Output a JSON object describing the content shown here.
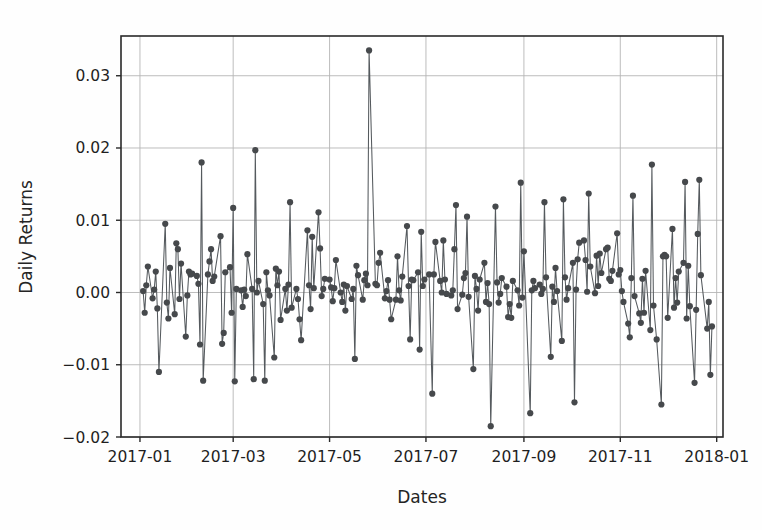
{
  "chart_data": {
    "type": "line",
    "title": "",
    "xlabel": "Dates",
    "ylabel": "Daily Returns",
    "grid": true,
    "legend": null,
    "marker": "circle",
    "line_color": "#555a5e",
    "marker_color": "#46494c",
    "grid_color": "#b6b6b6",
    "background_color": "#fefefe",
    "ylim": [
      -0.02,
      0.0355
    ],
    "xlim": [
      "2016-12-20",
      "2018-01-05"
    ],
    "yticks": [
      -0.02,
      -0.01,
      0.0,
      0.01,
      0.02,
      0.03
    ],
    "ytick_labels": [
      "−0.02",
      "−0.01",
      "0.00",
      "0.01",
      "0.02",
      "0.03"
    ],
    "xticks": [
      "2017-01",
      "2017-03",
      "2017-05",
      "2017-07",
      "2017-09",
      "2017-11",
      "2018-01"
    ],
    "xtick_labels": [
      "2017-01",
      "2017-03",
      "2017-05",
      "2017-07",
      "2017-09",
      "2017-11",
      "2018-01"
    ],
    "x": [
      "2017-01-03",
      "2017-01-04",
      "2017-01-05",
      "2017-01-06",
      "2017-01-09",
      "2017-01-10",
      "2017-01-11",
      "2017-01-12",
      "2017-01-13",
      "2017-01-17",
      "2017-01-18",
      "2017-01-19",
      "2017-01-20",
      "2017-01-23",
      "2017-01-24",
      "2017-01-25",
      "2017-01-26",
      "2017-01-27",
      "2017-01-30",
      "2017-01-31",
      "2017-02-01",
      "2017-02-02",
      "2017-02-03",
      "2017-02-06",
      "2017-02-07",
      "2017-02-08",
      "2017-02-09",
      "2017-02-10",
      "2017-02-13",
      "2017-02-14",
      "2017-02-15",
      "2017-02-16",
      "2017-02-17",
      "2017-02-21",
      "2017-02-22",
      "2017-02-23",
      "2017-02-24",
      "2017-02-27",
      "2017-02-28",
      "2017-03-01",
      "2017-03-02",
      "2017-03-03",
      "2017-03-06",
      "2017-03-07",
      "2017-03-08",
      "2017-03-09",
      "2017-03-10",
      "2017-03-13",
      "2017-03-14",
      "2017-03-15",
      "2017-03-16",
      "2017-03-17",
      "2017-03-20",
      "2017-03-21",
      "2017-03-22",
      "2017-03-23",
      "2017-03-24",
      "2017-03-27",
      "2017-03-28",
      "2017-03-29",
      "2017-03-30",
      "2017-03-31",
      "2017-04-03",
      "2017-04-04",
      "2017-04-05",
      "2017-04-06",
      "2017-04-07",
      "2017-04-10",
      "2017-04-11",
      "2017-04-12",
      "2017-04-13",
      "2017-04-17",
      "2017-04-18",
      "2017-04-19",
      "2017-04-20",
      "2017-04-21",
      "2017-04-24",
      "2017-04-25",
      "2017-04-26",
      "2017-04-27",
      "2017-04-28",
      "2017-05-01",
      "2017-05-02",
      "2017-05-03",
      "2017-05-04",
      "2017-05-05",
      "2017-05-08",
      "2017-05-09",
      "2017-05-10",
      "2017-05-11",
      "2017-05-12",
      "2017-05-15",
      "2017-05-16",
      "2017-05-17",
      "2017-05-18",
      "2017-05-19",
      "2017-05-22",
      "2017-05-23",
      "2017-05-24",
      "2017-05-25",
      "2017-05-26",
      "2017-05-30",
      "2017-05-31",
      "2017-06-01",
      "2017-06-02",
      "2017-06-05",
      "2017-06-06",
      "2017-06-07",
      "2017-06-08",
      "2017-06-09",
      "2017-06-12",
      "2017-06-13",
      "2017-06-14",
      "2017-06-15",
      "2017-06-16",
      "2017-06-19",
      "2017-06-20",
      "2017-06-21",
      "2017-06-22",
      "2017-06-23",
      "2017-06-26",
      "2017-06-27",
      "2017-06-28",
      "2017-06-29",
      "2017-06-30",
      "2017-07-03",
      "2017-07-05",
      "2017-07-06",
      "2017-07-07",
      "2017-07-10",
      "2017-07-11",
      "2017-07-12",
      "2017-07-13",
      "2017-07-14",
      "2017-07-17",
      "2017-07-18",
      "2017-07-19",
      "2017-07-20",
      "2017-07-21",
      "2017-07-24",
      "2017-07-25",
      "2017-07-26",
      "2017-07-27",
      "2017-07-28",
      "2017-07-31",
      "2017-08-01",
      "2017-08-02",
      "2017-08-03",
      "2017-08-04",
      "2017-08-07",
      "2017-08-08",
      "2017-08-09",
      "2017-08-10",
      "2017-08-11",
      "2017-08-14",
      "2017-08-15",
      "2017-08-16",
      "2017-08-17",
      "2017-08-18",
      "2017-08-21",
      "2017-08-22",
      "2017-08-23",
      "2017-08-24",
      "2017-08-25",
      "2017-08-28",
      "2017-08-29",
      "2017-08-30",
      "2017-08-31",
      "2017-09-01",
      "2017-09-05",
      "2017-09-06",
      "2017-09-07",
      "2017-09-08",
      "2017-09-11",
      "2017-09-12",
      "2017-09-13",
      "2017-09-14",
      "2017-09-15",
      "2017-09-18",
      "2017-09-19",
      "2017-09-20",
      "2017-09-21",
      "2017-09-22",
      "2017-09-25",
      "2017-09-26",
      "2017-09-27",
      "2017-09-28",
      "2017-09-29",
      "2017-10-02",
      "2017-10-03",
      "2017-10-04",
      "2017-10-05",
      "2017-10-06",
      "2017-10-09",
      "2017-10-10",
      "2017-10-11",
      "2017-10-12",
      "2017-10-13",
      "2017-10-16",
      "2017-10-17",
      "2017-10-18",
      "2017-10-19",
      "2017-10-20",
      "2017-10-23",
      "2017-10-24",
      "2017-10-25",
      "2017-10-26",
      "2017-10-27",
      "2017-10-30",
      "2017-10-31",
      "2017-11-01",
      "2017-11-02",
      "2017-11-03",
      "2017-11-06",
      "2017-11-07",
      "2017-11-08",
      "2017-11-09",
      "2017-11-10",
      "2017-11-13",
      "2017-11-14",
      "2017-11-15",
      "2017-11-16",
      "2017-11-17",
      "2017-11-20",
      "2017-11-21",
      "2017-11-22",
      "2017-11-24",
      "2017-11-27",
      "2017-11-28",
      "2017-11-29",
      "2017-11-30",
      "2017-12-01",
      "2017-12-04",
      "2017-12-05",
      "2017-12-06",
      "2017-12-07",
      "2017-12-08",
      "2017-12-11",
      "2017-12-12",
      "2017-12-13",
      "2017-12-14",
      "2017-12-15",
      "2017-12-18",
      "2017-12-19",
      "2017-12-20",
      "2017-12-21",
      "2017-12-22",
      "2017-12-26",
      "2017-12-27",
      "2017-12-28",
      "2017-12-29"
    ],
    "values": [
      0.0002,
      -0.0028,
      0.001,
      0.0036,
      -0.0008,
      0.0004,
      0.0029,
      -0.0022,
      -0.011,
      0.0095,
      -0.0014,
      -0.0036,
      0.0034,
      -0.003,
      0.0068,
      0.006,
      -0.0009,
      0.004,
      -0.0061,
      -0.0004,
      0.0029,
      0.0025,
      0.0026,
      0.0023,
      0.0012,
      -0.0072,
      0.018,
      -0.0122,
      0.0025,
      0.0043,
      0.006,
      0.0016,
      0.0022,
      0.0078,
      -0.0071,
      -0.0056,
      0.0028,
      0.0035,
      -0.0028,
      0.0117,
      -0.0123,
      0.0005,
      0.0003,
      -0.002,
      0.0004,
      -0.0005,
      0.0053,
      0.0005,
      -0.012,
      0.0197,
      0.0,
      0.0016,
      -0.0016,
      -0.0122,
      0.0028,
      0.0003,
      -0.0004,
      -0.009,
      0.0033,
      0.001,
      0.0029,
      -0.0038,
      0.0005,
      -0.0025,
      0.0011,
      0.0125,
      -0.0021,
      0.0005,
      -0.0009,
      -0.0037,
      -0.0066,
      0.0086,
      0.001,
      -0.0023,
      0.0077,
      0.0006,
      0.0111,
      0.0061,
      -0.0005,
      0.0005,
      0.0019,
      0.0018,
      0.0007,
      -0.0012,
      0.0006,
      0.0045,
      0.0,
      -0.0013,
      0.0011,
      -0.0025,
      0.0009,
      -0.0009,
      0.0005,
      -0.0092,
      0.0037,
      0.0024,
      -0.001,
      0.0017,
      0.0026,
      0.001,
      0.0335,
      0.0012,
      0.001,
      0.0041,
      0.0055,
      -0.0008,
      0.0002,
      0.0017,
      -0.001,
      -0.0037,
      -0.001,
      0.005,
      0.0003,
      -0.0011,
      0.0022,
      0.0092,
      0.0009,
      -0.0065,
      0.0018,
      0.0017,
      0.0028,
      -0.0079,
      0.0084,
      0.0009,
      0.0018,
      0.0025,
      -0.014,
      0.0025,
      0.007,
      0.0016,
      0.0,
      0.0072,
      0.0018,
      -0.0002,
      -0.0004,
      0.0003,
      0.006,
      0.0121,
      -0.0023,
      -0.0003,
      0.002,
      0.0027,
      0.0105,
      -0.0006,
      -0.0106,
      0.0023,
      0.0005,
      -0.0025,
      0.0018,
      0.0041,
      -0.0013,
      0.0013,
      -0.0016,
      -0.0185,
      0.0119,
      0.0014,
      -0.0014,
      -0.0002,
      0.002,
      0.0008,
      -0.0034,
      -0.0016,
      -0.0035,
      0.0016,
      0.0003,
      -0.0018,
      0.0152,
      -0.0007,
      0.0057,
      -0.0167,
      0.0003,
      0.0016,
      0.0006,
      0.0011,
      -0.0002,
      0.0005,
      0.0125,
      0.0021,
      -0.0089,
      0.0008,
      -0.0013,
      0.0034,
      0.0002,
      -0.0067,
      0.0129,
      0.0021,
      -0.001,
      0.0006,
      0.0041,
      -0.0152,
      0.0004,
      0.0046,
      0.0069,
      0.0072,
      0.0045,
      0.0001,
      0.0137,
      0.0036,
      -0.0001,
      0.0051,
      0.0009,
      0.0054,
      0.0027,
      0.006,
      0.0062,
      0.0019,
      0.0016,
      0.003,
      0.0082,
      0.0025,
      0.0031,
      0.0002,
      -0.0013,
      -0.0043,
      -0.0062,
      0.002,
      0.0134,
      -0.0005,
      -0.0029,
      -0.0042,
      0.0019,
      -0.0028,
      0.003,
      -0.0052,
      0.0177,
      -0.0018,
      -0.0065,
      -0.0155,
      0.005,
      0.0052,
      0.005,
      -0.0035,
      0.0088,
      -0.0021,
      0.002,
      -0.0014,
      0.0029,
      0.0041,
      0.0153,
      -0.0036,
      0.0037,
      -0.0019,
      -0.0125,
      -0.0024,
      0.0081,
      0.0156,
      0.0024,
      -0.005,
      -0.0013,
      -0.0114,
      -0.0047
    ]
  }
}
